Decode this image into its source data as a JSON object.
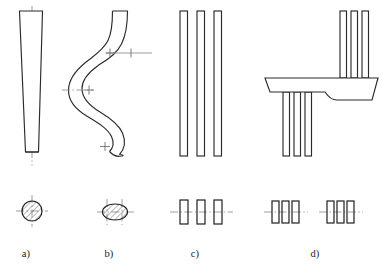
{
  "figure": {
    "background_color": "#ffffff",
    "outline_color": "#2b2b2b",
    "centerline_color": "#8e8e8e",
    "hatch_color": "#3a3a3a",
    "width_px": 383,
    "height_px": 271
  },
  "captions": [
    {
      "label": "a)",
      "x": 26,
      "y": 257
    },
    {
      "label": "b)",
      "x": 109,
      "y": 257
    },
    {
      "label": "c)",
      "x": 195,
      "y": 257
    },
    {
      "label": "d)",
      "x": 315,
      "y": 257
    }
  ],
  "parts": [
    {
      "id": "a",
      "name": "tapered-round-rod",
      "description": "Straight conical rod tapering from wide top to narrow bottom, vertical centerline",
      "section_shape": "circle",
      "section_count": 1
    },
    {
      "id": "b",
      "name": "serpentine-oval-rod",
      "description": "S-curved rod of oval cross section with three centre cross marks",
      "section_shape": "ellipse",
      "section_count": 1,
      "cross_marks": 3
    },
    {
      "id": "c",
      "name": "three-flat-bars",
      "description": "Three parallel straight flat bars",
      "section_shape": "rectangle",
      "section_count": 3
    },
    {
      "id": "d",
      "name": "bent-bar-assembly",
      "description": "Trapezoidal plate with filleted right end, three bars rising above and three bars hanging below",
      "section_shape": "rectangle",
      "section_count": 6,
      "section_groups": 2
    }
  ],
  "sections": {
    "a": {
      "type": "circle",
      "cx": 32,
      "cy": 211,
      "r": 10.5,
      "hatched": true,
      "centerlines": true
    },
    "b": {
      "type": "ellipse",
      "cx": 115,
      "cy": 212,
      "rx": 13,
      "ry": 8.5,
      "hatched": true,
      "centerlines": true
    },
    "c": {
      "type": "rectangles",
      "rects": [
        {
          "x": 180,
          "y": 200,
          "w": 8,
          "h": 24
        },
        {
          "x": 197,
          "y": 200,
          "w": 8,
          "h": 24
        },
        {
          "x": 214,
          "y": 200,
          "w": 8,
          "h": 24
        }
      ],
      "centerline": {
        "x1": 170,
        "x2": 232,
        "y": 212
      }
    },
    "d": {
      "type": "rectangles",
      "group1": [
        {
          "x": 272,
          "y": 201,
          "w": 7,
          "h": 22
        },
        {
          "x": 282,
          "y": 201,
          "w": 7,
          "h": 22
        },
        {
          "x": 292,
          "y": 201,
          "w": 7,
          "h": 22
        }
      ],
      "group2": [
        {
          "x": 327,
          "y": 201,
          "w": 7,
          "h": 22
        },
        {
          "x": 337,
          "y": 201,
          "w": 7,
          "h": 22
        },
        {
          "x": 347,
          "y": 201,
          "w": 7,
          "h": 22
        }
      ],
      "centerline1": {
        "x1": 264,
        "x2": 307,
        "y": 212
      },
      "centerline2": {
        "x1": 319,
        "x2": 362,
        "y": 212
      }
    }
  }
}
